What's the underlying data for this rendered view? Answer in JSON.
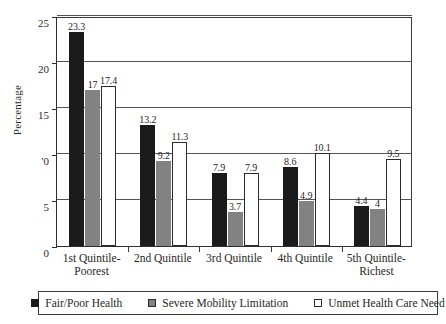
{
  "chart_data": {
    "type": "bar",
    "title": "",
    "xlabel": "",
    "ylabel": "Percentage",
    "ylim": [
      0,
      25
    ],
    "yticks": [
      0,
      5,
      10,
      15,
      20,
      25
    ],
    "ytick_labels": [
      "0",
      "5",
      "'0",
      "15",
      "20",
      "25"
    ],
    "grid": true,
    "legend_position": "bottom",
    "categories": [
      "1st Quintile-\nPoorest",
      "2nd Quintile",
      "3rd Quintile",
      "4th Quintile",
      "5th Quintile-\nRichest"
    ],
    "series": [
      {
        "name": "Fair/Poor Health",
        "color": "#1b1b1b",
        "values": [
          23.3,
          13.2,
          7.9,
          8.6,
          4.4
        ],
        "labels": [
          "23.3",
          "13.2",
          "7.9",
          "8.6",
          "4.4"
        ]
      },
      {
        "name": "Severe Mobility Limitation",
        "color": "#828282",
        "values": [
          17,
          9.2,
          3.7,
          4.9,
          4
        ],
        "labels": [
          "17",
          "9.2",
          "3.7",
          "4.9",
          "4"
        ]
      },
      {
        "name": "Unmet Health Care Need",
        "color": "#ffffff",
        "values": [
          17.4,
          11.3,
          7.9,
          10.1,
          9.5
        ],
        "labels": [
          "17.4",
          "11.3",
          "7.9",
          "10.1",
          "9.5"
        ]
      }
    ]
  }
}
